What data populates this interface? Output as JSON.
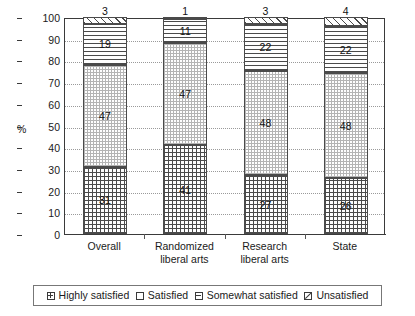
{
  "chart_data": {
    "type": "bar",
    "subtype": "stacked-bar-100",
    "title": "",
    "xlabel": "",
    "ylabel": "%",
    "ylim": [
      0,
      100
    ],
    "ytick_step": 10,
    "yticks": [
      "100",
      "90",
      "80",
      "70",
      "60",
      "50",
      "40",
      "30",
      "20",
      "10",
      "0"
    ],
    "grid": true,
    "grid_axis": "y",
    "legend_position": "bottom",
    "categories": [
      "Overall",
      "Randomized liberal arts",
      "Research liberal arts",
      "State"
    ],
    "category_lines": [
      [
        "Overall"
      ],
      [
        "Randomized",
        "liberal arts"
      ],
      [
        "Research",
        "liberal arts"
      ],
      [
        "State"
      ]
    ],
    "series": [
      {
        "name": "Highly satisfied",
        "pattern": "dense-grid",
        "values": [
          31,
          41,
          27,
          26
        ]
      },
      {
        "name": "Satisfied",
        "pattern": "fine-light-dots",
        "values": [
          47,
          47,
          48,
          48
        ]
      },
      {
        "name": "Somewhat satisfied",
        "pattern": "horizontal-lines",
        "values": [
          19,
          11,
          22,
          22
        ]
      },
      {
        "name": "Unsatisfied",
        "pattern": "diagonal-hatch",
        "values": [
          3,
          1,
          3,
          4
        ]
      }
    ]
  },
  "legend": {
    "items": [
      {
        "label": "Highly satisfied",
        "swatch": "highly-satisfied-swatch-icon"
      },
      {
        "label": "Satisfied",
        "swatch": "satisfied-swatch-icon"
      },
      {
        "label": "Somewhat satisfied",
        "swatch": "somewhat-satisfied-swatch-icon"
      },
      {
        "label": "Unsatisfied",
        "swatch": "unsatisfied-swatch-icon"
      }
    ]
  },
  "colors": {
    "axis": "#3a3a3a",
    "grid": "#9a9a9a",
    "pattern_ink": "#4a4a4a",
    "pattern_light": "#b4b4b4",
    "text": "#1a1a1a",
    "background": "#ffffff"
  }
}
